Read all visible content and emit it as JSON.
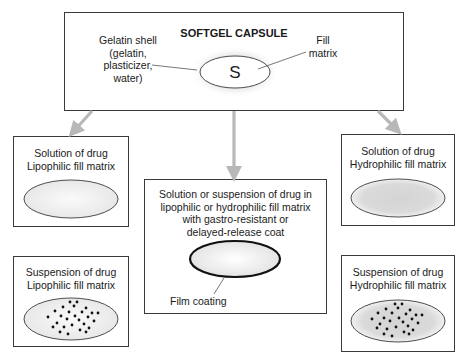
{
  "diagram": {
    "title": "SOFTGEL CAPSULE",
    "capsule_symbol": "S",
    "shell_label": "Gelatin shell\n(gelatin,\nplasticizer,\nwater)",
    "fill_label": "Fill\nmatrix",
    "boxes": [
      {
        "id": "solution-lipophilic",
        "label": "Solution of drug\nLipophilic fill matrix",
        "fill": "solution",
        "matrix": "lipophilic"
      },
      {
        "id": "suspension-lipophilic",
        "label": "Suspension of drug\nLipophilic fill matrix",
        "fill": "suspension",
        "matrix": "lipophilic"
      },
      {
        "id": "coated",
        "label": "Solution or suspension of drug in\nlipophilic or hydrophilic fill matrix\nwith gastro-resistant or\ndelayed-release coat",
        "annotation": "Film coating"
      },
      {
        "id": "solution-hydrophilic",
        "label": "Solution of drug\nHydrophilic fill matrix",
        "fill": "solution",
        "matrix": "hydrophilic"
      },
      {
        "id": "suspension-hydrophilic",
        "label": "Suspension of drug\nHydrophilic fill matrix",
        "fill": "suspension",
        "matrix": "hydrophilic"
      }
    ],
    "colors": {
      "border": "#3a3a3a",
      "arrow": "#b8b8b8",
      "lipophilic_fill": "#f0f0f0",
      "hydrophilic_fill": "#d9d9d9",
      "capsule_glow": "#e6e6e6",
      "dot": "#111111"
    }
  }
}
